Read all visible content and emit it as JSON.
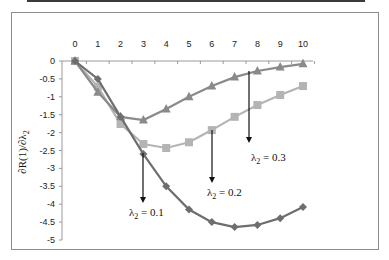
{
  "chart_data": {
    "type": "line",
    "title": "",
    "xlabel": "",
    "ylabel": "∂R(1)/∂λ2",
    "x": [
      0,
      1,
      2,
      3,
      4,
      5,
      6,
      7,
      8,
      9,
      10
    ],
    "xlim": [
      0,
      10
    ],
    "ylim": [
      -5,
      0
    ],
    "x_tick_labels": [
      "0",
      "1",
      "2",
      "3",
      "4",
      "5",
      "6",
      "7",
      "8",
      "9",
      "10"
    ],
    "y_tick_labels": [
      "0",
      "-0.5",
      "-1",
      "-1.5",
      "-2",
      "-2.5",
      "-3",
      "-3.5",
      "-4",
      "-4.5",
      "-5"
    ],
    "x_axis_position": "top",
    "grid": false,
    "legend": "none (inline annotations with arrows)",
    "series": [
      {
        "name": "λ2 = 0.1",
        "marker": "diamond",
        "color": "#6e6e6e",
        "values": [
          0,
          -0.5,
          -1.56,
          -2.6,
          -3.5,
          -4.15,
          -4.5,
          -4.64,
          -4.58,
          -4.39,
          -4.08
        ]
      },
      {
        "name": "λ2 = 0.2",
        "marker": "square",
        "color": "#b4b4b4",
        "values": [
          0,
          -0.72,
          -1.76,
          -2.32,
          -2.43,
          -2.27,
          -1.93,
          -1.56,
          -1.23,
          -0.95,
          -0.7
        ]
      },
      {
        "name": "λ2 = 0.3",
        "marker": "triangle",
        "color": "#8a8a8a",
        "values": [
          0,
          -0.87,
          -1.56,
          -1.65,
          -1.34,
          -1.0,
          -0.7,
          -0.45,
          -0.28,
          -0.17,
          -0.08
        ]
      }
    ],
    "annotations": [
      {
        "text": "λ2 = 0.1",
        "arrow_x": 3,
        "label_sub": "2"
      },
      {
        "text": "λ2 = 0.2",
        "arrow_x": 6,
        "label_sub": "2"
      },
      {
        "text": "λ2 = 0.3",
        "arrow_x": 7.6,
        "label_sub": "2"
      }
    ]
  },
  "labels": {
    "ylabel_main": "∂R(1)/∂λ",
    "ylabel_sub": "2",
    "ann1_main": "λ",
    "ann1_sub": "2",
    "ann1_val": " = 0.1",
    "ann2_main": "λ",
    "ann2_sub": "2",
    "ann2_val": " = 0.2",
    "ann3_main": "λ",
    "ann3_sub": "2",
    "ann3_val": " = 0.3"
  }
}
